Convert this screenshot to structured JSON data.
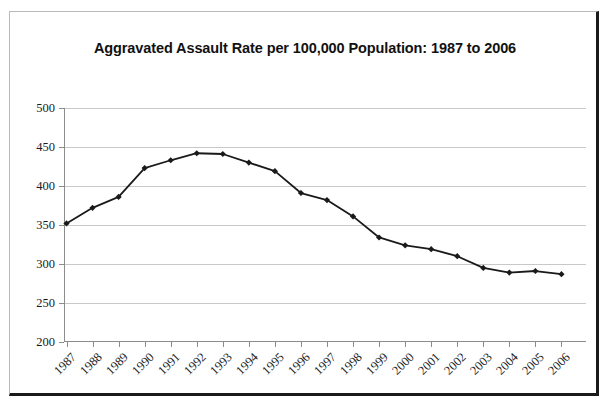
{
  "figure": {
    "title": "Aggravated Assault Rate per 100,000 Population: 1987 to 2006",
    "border_color": "#1a1a1a",
    "background": "#ffffff"
  },
  "chart_data": {
    "type": "line",
    "title": "Aggravated Assault Rate per 100,000 Population: 1987 to 2006",
    "xlabel": "",
    "ylabel": "",
    "categories": [
      "1987",
      "1988",
      "1989",
      "1990",
      "1991",
      "1992",
      "1993",
      "1994",
      "1995",
      "1996",
      "1997",
      "1998",
      "1999",
      "2000",
      "2001",
      "2002",
      "2003",
      "2004",
      "2005",
      "2006"
    ],
    "values": [
      352,
      372,
      386,
      423,
      433,
      442,
      441,
      430,
      419,
      391,
      382,
      361,
      334,
      324,
      319,
      310,
      295,
      289,
      291,
      287
    ],
    "series": [
      {
        "name": "Aggravated assault rate",
        "values": [
          352,
          372,
          386,
          423,
          433,
          442,
          441,
          430,
          419,
          391,
          382,
          361,
          334,
          324,
          319,
          310,
          295,
          289,
          291,
          287
        ],
        "color": "#1a1a1a",
        "marker": "diamond"
      }
    ],
    "ylim": [
      200,
      500
    ],
    "yticks": [
      200,
      250,
      300,
      350,
      400,
      450,
      500
    ],
    "ytick_labels": [
      "200",
      "250",
      "300",
      "350",
      "400",
      "450",
      "500"
    ],
    "xtick_labels": [
      "1987",
      "1988",
      "1989",
      "1990",
      "1991",
      "1992",
      "1993",
      "1994",
      "1995",
      "1996",
      "1997",
      "1998",
      "1999",
      "2000",
      "2001",
      "2002",
      "2003",
      "2004",
      "2005",
      "2006"
    ],
    "xtick_rotation": -45,
    "grid": "horizontal",
    "grid_color": "#c8c8c8",
    "legend": null,
    "legend_position": "none",
    "line_color": "#1a1a1a",
    "line_width": 1.8
  }
}
